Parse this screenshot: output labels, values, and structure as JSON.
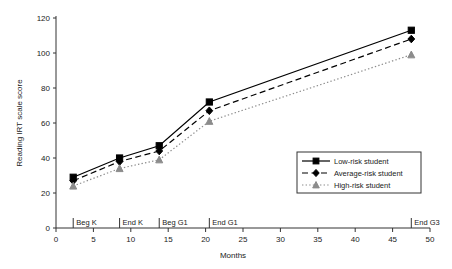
{
  "chart_data": {
    "type": "line",
    "title": "",
    "xlabel": "Months",
    "ylabel": "Reading IRT scale score",
    "xlim": [
      0,
      50
    ],
    "ylim": [
      0,
      120
    ],
    "xticks": [
      0,
      5,
      10,
      15,
      20,
      25,
      30,
      35,
      40,
      45,
      50
    ],
    "yticks": [
      0,
      20,
      40,
      60,
      80,
      100,
      120
    ],
    "grid": false,
    "legend_position": "center-right",
    "x": [
      2.3,
      8.5,
      13.8,
      20.5,
      47.5
    ],
    "period_annotations": [
      {
        "label": "Beg K",
        "x": 2.3
      },
      {
        "label": "End K",
        "x": 8.5
      },
      {
        "label": "Beg G1",
        "x": 13.8
      },
      {
        "label": "End G1",
        "x": 20.5
      },
      {
        "label": "End G3",
        "x": 47.5
      }
    ],
    "series": [
      {
        "name": "Low-risk student",
        "marker": "square",
        "line_style": "solid",
        "color": "#000000",
        "values": [
          29,
          40,
          47,
          72,
          113
        ]
      },
      {
        "name": "Average-risk student",
        "marker": "diamond",
        "line_style": "dashed",
        "color": "#000000",
        "values": [
          27,
          38,
          44,
          67,
          108
        ]
      },
      {
        "name": "High-risk student",
        "marker": "triangle",
        "line_style": "dotted",
        "color": "#8c8c8c",
        "values": [
          24,
          34,
          39,
          61,
          99
        ]
      }
    ]
  },
  "legend": {
    "items": [
      {
        "label": "Low-risk student"
      },
      {
        "label": "Average-risk student"
      },
      {
        "label": "High-risk student"
      }
    ]
  },
  "axis": {
    "y_title": "Reading IRT scale score",
    "x_title": "Months",
    "y_tick_labels": [
      "0",
      "20",
      "40",
      "60",
      "80",
      "100",
      "120"
    ],
    "x_tick_labels": [
      "0",
      "5",
      "10",
      "15",
      "20",
      "25",
      "30",
      "35",
      "40",
      "45",
      "50"
    ]
  },
  "periods": {
    "labels": [
      "Beg K",
      "End K",
      "Beg G1",
      "End G1",
      "End G3"
    ]
  }
}
